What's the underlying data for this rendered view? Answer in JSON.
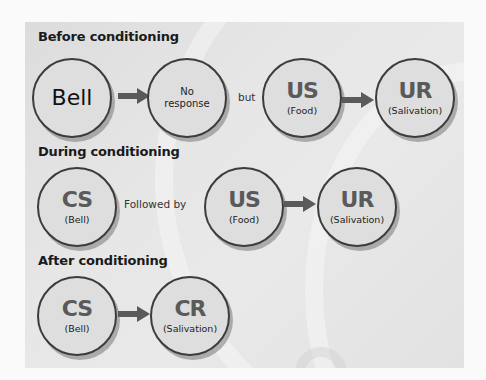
{
  "diagram": {
    "colors": {
      "background": "#fafafa",
      "panel": "#e4e4e4",
      "circle_fill": "#dedede",
      "circle_border": "#3c3c3c",
      "arrow": "#5a5a5a",
      "abbr_text": "#5a5a5a"
    },
    "rows": [
      {
        "title": "Before conditioning",
        "nodes": [
          {
            "main": "Bell",
            "sub": ""
          },
          {
            "main": "No response",
            "line1": "No",
            "line2": "response"
          },
          {
            "main": "US",
            "sub": "(Food)"
          },
          {
            "main": "UR",
            "sub": "(Salivation)"
          }
        ],
        "connectors": [
          "arrow",
          "but",
          "arrow"
        ]
      },
      {
        "title": "During conditioning",
        "nodes": [
          {
            "main": "CS",
            "sub": "(Bell)"
          },
          {
            "main": "US",
            "sub": "(Food)"
          },
          {
            "main": "UR",
            "sub": "(Salivation)"
          }
        ],
        "connectors": [
          "Followed by",
          "arrow"
        ]
      },
      {
        "title": "After conditioning",
        "nodes": [
          {
            "main": "CS",
            "sub": "(Bell)"
          },
          {
            "main": "CR",
            "sub": "(Salivation)"
          }
        ],
        "connectors": [
          "arrow"
        ]
      }
    ]
  }
}
